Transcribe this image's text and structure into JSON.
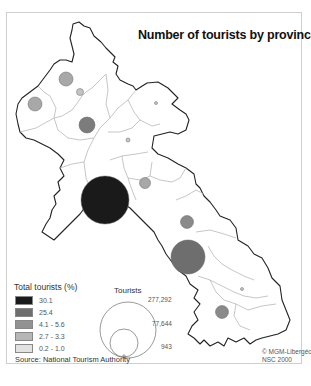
{
  "title": "Number of tourists by province",
  "legend": {
    "title": "Total tourists (%)",
    "classes": [
      {
        "label": "30.1",
        "color": "#1a1a1a"
      },
      {
        "label": "25.4",
        "color": "#6e6e6e"
      },
      {
        "label": "4.1 - 5.6",
        "color": "#929292"
      },
      {
        "label": "2.7 - 3.3",
        "color": "#b6b6b6"
      },
      {
        "label": "0.2 - 1.0",
        "color": "#e2e2e2"
      }
    ]
  },
  "size_legend": {
    "title": "Tourists",
    "values": [
      "277,292",
      "77,644",
      "943"
    ]
  },
  "source": "Source: National Tourism Authority",
  "credit": {
    "line1": "© MGM-Libergéo",
    "line2": "NSC 2000"
  },
  "symbols": [
    {
      "name": "province-north-west-1",
      "cx": 66,
      "cy": 79,
      "r": 7,
      "color": "#a8a8a8"
    },
    {
      "name": "province-north-west-2",
      "cx": 35,
      "cy": 104,
      "r": 7,
      "color": "#a8a8a8"
    },
    {
      "name": "province-north-3",
      "cx": 80,
      "cy": 92,
      "r": 3,
      "color": "#c4c4c4"
    },
    {
      "name": "province-north-4",
      "cx": 87,
      "cy": 125,
      "r": 8,
      "color": "#7c7c7c"
    },
    {
      "name": "province-north-5",
      "cx": 128,
      "cy": 141,
      "r": 1.5,
      "color": "#c4c4c4"
    },
    {
      "name": "province-north-east-6",
      "cx": 156,
      "cy": 104,
      "r": 1.5,
      "color": "#c4c4c4"
    },
    {
      "name": "province-central-7",
      "cx": 128,
      "cy": 140,
      "r": 1.5,
      "color": "#c4c4c4"
    },
    {
      "name": "vientiane-capital",
      "cx": 105,
      "cy": 200,
      "r": 24,
      "color": "#1a1a1a"
    },
    {
      "name": "province-central-8",
      "cx": 145,
      "cy": 184,
      "r": 5.5,
      "color": "#a8a8a8"
    },
    {
      "name": "province-central-9",
      "cx": 187,
      "cy": 222,
      "r": 6.5,
      "color": "#8a8a8a"
    },
    {
      "name": "luang-prabang-like-south",
      "cx": 188,
      "cy": 257,
      "r": 17,
      "color": "#6e6e6e"
    },
    {
      "name": "province-south-10",
      "cx": 222,
      "cy": 312,
      "r": 6.5,
      "color": "#8a8a8a"
    },
    {
      "name": "province-south-11",
      "cx": 242,
      "cy": 289,
      "r": 1.5,
      "color": "#c4c4c4"
    }
  ]
}
